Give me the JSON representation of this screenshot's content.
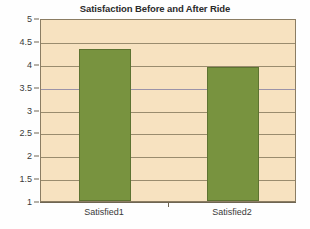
{
  "chart_data": {
    "type": "bar",
    "title": "Satisfaction Before and After Ride",
    "categories": [
      "Satisfied1",
      "Satisfied2"
    ],
    "values": [
      4.33,
      3.94
    ],
    "xlabel": "",
    "ylabel": "",
    "ylim": [
      1,
      5
    ],
    "ytick_labels": [
      "5",
      "4.5",
      "4",
      "3.5",
      "3",
      "2.5",
      "2",
      "1.5",
      "1"
    ],
    "ytick_values": [
      5,
      4.5,
      4,
      3.5,
      3,
      2.5,
      2,
      1.5,
      1
    ],
    "grid": true,
    "legend": false,
    "colors": {
      "bar_fill": "#78933f",
      "bar_border": "#5d7331",
      "plot_background": "#f7e2c0",
      "gridline": "#9a8c6e",
      "gridline_accent": "#9b93a8",
      "axis": "#6f6552",
      "title_text": "#2b2b2b",
      "tick_text": "#3a3a3a",
      "page_background": "#ffffff"
    }
  }
}
